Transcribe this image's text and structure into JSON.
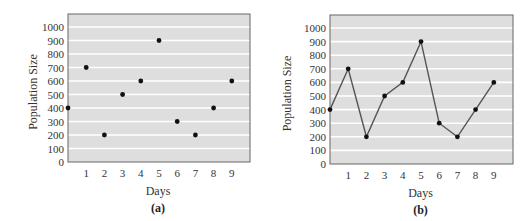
{
  "chart_data": [
    {
      "type": "scatter",
      "caption": "(a)",
      "title": "",
      "xlabel": "Days",
      "ylabel": "Population Size",
      "x": [
        0,
        1,
        2,
        3,
        4,
        5,
        6,
        7,
        8,
        9
      ],
      "values": [
        400,
        700,
        200,
        500,
        600,
        900,
        300,
        200,
        400,
        600
      ],
      "xticks": [
        "1",
        "2",
        "3",
        "4",
        "5",
        "6",
        "7",
        "8",
        "9"
      ],
      "yticks": [
        "0",
        "100",
        "200",
        "300",
        "400",
        "500",
        "600",
        "700",
        "800",
        "900",
        "1000"
      ],
      "ylim": [
        0,
        1000
      ],
      "xlim": [
        0,
        10
      ],
      "grid": true,
      "legend": null
    },
    {
      "type": "line",
      "caption": "(b)",
      "title": "",
      "xlabel": "Days",
      "ylabel": "Population Size",
      "x": [
        0,
        1,
        2,
        3,
        4,
        5,
        6,
        7,
        8,
        9
      ],
      "values": [
        400,
        700,
        200,
        500,
        600,
        900,
        300,
        200,
        400,
        600
      ],
      "xticks": [
        "1",
        "2",
        "3",
        "4",
        "5",
        "6",
        "7",
        "8",
        "9"
      ],
      "yticks": [
        "0",
        "100",
        "200",
        "300",
        "400",
        "500",
        "600",
        "700",
        "800",
        "900",
        "1000"
      ],
      "ylim": [
        0,
        1000
      ],
      "xlim": [
        0,
        10
      ],
      "grid": true,
      "legend": null
    }
  ],
  "colors": {
    "plot_bg": "#dedede",
    "grid": "#ffffff",
    "frame": "#666666",
    "marker": "#111111",
    "line": "#555555"
  }
}
